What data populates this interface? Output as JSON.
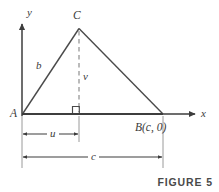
{
  "figure": {
    "caption": "FIGURE 5",
    "width": 219,
    "height": 192,
    "background_color": "#ffffff",
    "stroke_color": "#3d3d3d",
    "dashed_color": "#8a8a8a",
    "label_color": "#3a3a3a"
  },
  "axes": {
    "y_label": "y",
    "x_label": "x",
    "origin_px": {
      "x": 22,
      "y": 114
    },
    "y_axis_top_px": 22,
    "x_axis_right_px": 197
  },
  "triangle": {
    "vertices": [
      {
        "name": "A",
        "label": "A",
        "x": 22,
        "y": 114
      },
      {
        "name": "C",
        "label": "C",
        "x": 79,
        "y": 28
      },
      {
        "name": "B",
        "label": "B(c, 0)",
        "x": 163,
        "y": 114
      }
    ],
    "side_labels": [
      {
        "name": "side-ac",
        "label": "b",
        "x": 40,
        "y": 66
      }
    ]
  },
  "altitude": {
    "label": "v",
    "from_px": {
      "x": 79,
      "y": 28
    },
    "to_px": {
      "x": 79,
      "y": 114
    },
    "style": "dashed",
    "right_angle_marker": true
  },
  "dimensions": [
    {
      "name": "dimension-u",
      "label": "u",
      "from_px": 22,
      "to_px": 79,
      "y_px": 134,
      "description": "horizontal distance from A to foot of altitude"
    },
    {
      "name": "dimension-c",
      "label": "c",
      "from_px": 22,
      "to_px": 163,
      "y_px": 157,
      "description": "horizontal distance from A to B"
    }
  ],
  "extension_lines": [
    {
      "name": "ext-line-a",
      "x": 22,
      "y1": 114,
      "y2": 168
    },
    {
      "name": "ext-line-foot",
      "x": 79,
      "y1": 114,
      "y2": 142
    },
    {
      "name": "ext-line-b",
      "x": 163,
      "y1": 114,
      "y2": 168
    }
  ]
}
